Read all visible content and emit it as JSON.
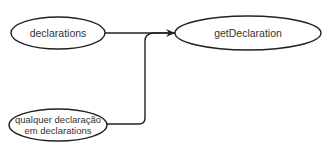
{
  "diagram": {
    "nodes": [
      {
        "id": "declarations",
        "label": "declarations"
      },
      {
        "id": "getDeclaration",
        "label": "getDeclaration"
      },
      {
        "id": "qualquer",
        "label_line1": "qualquer declaração",
        "label_line2": "em declarations"
      }
    ],
    "edges": [
      {
        "from": "declarations",
        "to": "getDeclaration"
      },
      {
        "from": "qualquer",
        "to": "getDeclaration"
      }
    ],
    "colors": {
      "stroke": "#222222",
      "text": "#333333",
      "background": "#ffffff"
    }
  }
}
